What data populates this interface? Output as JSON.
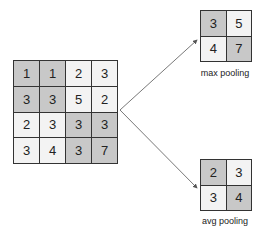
{
  "colors": {
    "shaded": "#c8c8c8",
    "light": "#f3f3f3",
    "border": "#333333",
    "arrow": "#555555"
  },
  "input_grid": {
    "cells": [
      {
        "v": "1",
        "shade": true
      },
      {
        "v": "1",
        "shade": true
      },
      {
        "v": "2",
        "shade": false
      },
      {
        "v": "3",
        "shade": false
      },
      {
        "v": "3",
        "shade": true
      },
      {
        "v": "3",
        "shade": true
      },
      {
        "v": "5",
        "shade": false
      },
      {
        "v": "2",
        "shade": false
      },
      {
        "v": "2",
        "shade": false
      },
      {
        "v": "3",
        "shade": false
      },
      {
        "v": "3",
        "shade": true
      },
      {
        "v": "3",
        "shade": true
      },
      {
        "v": "3",
        "shade": false
      },
      {
        "v": "4",
        "shade": false
      },
      {
        "v": "3",
        "shade": true
      },
      {
        "v": "7",
        "shade": true
      }
    ]
  },
  "max_pool": {
    "label": "max pooling",
    "cells": [
      {
        "v": "3",
        "shade": true
      },
      {
        "v": "5",
        "shade": false
      },
      {
        "v": "4",
        "shade": false
      },
      {
        "v": "7",
        "shade": true
      }
    ]
  },
  "avg_pool": {
    "label": "avg pooling",
    "cells": [
      {
        "v": "2",
        "shade": true
      },
      {
        "v": "3",
        "shade": false
      },
      {
        "v": "3",
        "shade": false
      },
      {
        "v": "4",
        "shade": true
      }
    ]
  }
}
